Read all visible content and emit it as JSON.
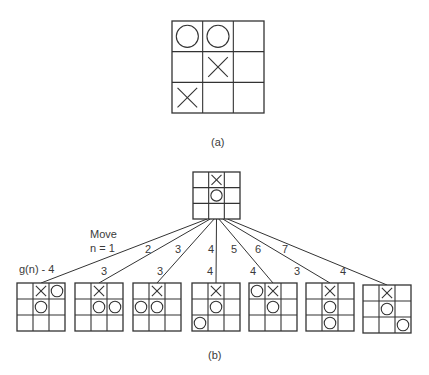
{
  "diagram": {
    "line_color": "#333333",
    "text_color": "#3a3a3a",
    "part_a": {
      "caption": "(a)",
      "board": {
        "x": 172,
        "y": 21,
        "size": 92,
        "cells": [
          "O",
          "O",
          "",
          "",
          "X",
          "",
          "X",
          "",
          ""
        ]
      }
    },
    "part_b": {
      "caption": "(b)",
      "root": {
        "x": 193,
        "y": 172,
        "size": 47,
        "cells": [
          "",
          "X",
          "",
          "",
          "O",
          "",
          "",
          "",
          ""
        ]
      },
      "move_label": [
        "Move",
        "n = 1"
      ],
      "gn_label": "g(n) - 4",
      "children": [
        {
          "x": 17,
          "y": 283,
          "edge_label": "",
          "g_label": "",
          "cells": [
            "",
            "X",
            "O",
            "",
            "O",
            "",
            "",
            "",
            ""
          ]
        },
        {
          "x": 75,
          "y": 283,
          "edge_label": "2",
          "g_label": "3",
          "cells": [
            "",
            "X",
            "",
            "",
            "O",
            "O",
            "",
            "",
            ""
          ]
        },
        {
          "x": 133,
          "y": 283,
          "edge_label": "3",
          "g_label": "3",
          "cells": [
            "",
            "X",
            "",
            "O",
            "O",
            "",
            "",
            "",
            ""
          ]
        },
        {
          "x": 192,
          "y": 283,
          "edge_label": "4",
          "g_label": "4",
          "cells": [
            "",
            "X",
            "",
            "",
            "O",
            "",
            "O",
            "",
            ""
          ]
        },
        {
          "x": 249,
          "y": 283,
          "edge_label": "5",
          "g_label": "4",
          "cells": [
            "O",
            "X",
            "",
            "",
            "O",
            "",
            "",
            "",
            ""
          ]
        },
        {
          "x": 306,
          "y": 283,
          "edge_label": "6",
          "g_label": "3",
          "cells": [
            "",
            "X",
            "",
            "",
            "O",
            "",
            "",
            "O",
            ""
          ]
        },
        {
          "x": 363,
          "y": 285,
          "edge_label": "7",
          "g_label": "4",
          "cells": [
            "",
            "X",
            "",
            "",
            "O",
            "",
            "",
            "",
            "O"
          ]
        }
      ],
      "child_size": 48
    }
  }
}
